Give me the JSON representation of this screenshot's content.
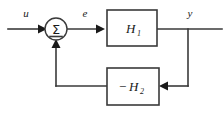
{
  "diagram": {
    "background_color": "#ffffff",
    "line_color": "#3a3a3a",
    "text_color": "#1a1a1a",
    "signals": {
      "input": "u",
      "error": "e",
      "output": "y"
    },
    "blocks": [
      {
        "id": "forward",
        "label_base": "H",
        "label_sub": "1",
        "sign": ""
      },
      {
        "id": "feedback",
        "label_base": "H",
        "label_sub": "2",
        "sign": "−"
      }
    ],
    "summing_junction": {
      "glyph": "Σ",
      "name": "sigma"
    },
    "icons": {
      "arrow_right": "arrow-right-icon",
      "arrow_left": "arrow-left-icon",
      "arrow_up": "arrow-up-icon"
    }
  }
}
